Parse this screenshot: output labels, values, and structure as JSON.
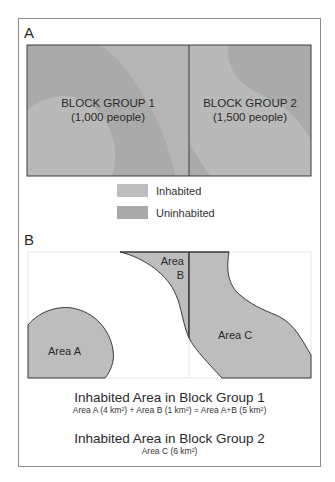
{
  "colors": {
    "inhabited": "#bdbdbd",
    "uninhabited": "#a9a9a9",
    "outline": "#3a3a3a",
    "frame": "#8a8a8a"
  },
  "panel_a": {
    "label": "A",
    "block_groups": [
      {
        "name": "BLOCK GROUP 1",
        "population": "(1,000 people)"
      },
      {
        "name": "BLOCK GROUP 2",
        "population": "(1,500 people)"
      }
    ]
  },
  "legend": {
    "items": [
      {
        "label": "Inhabited",
        "color": "#bdbdbd"
      },
      {
        "label": "Uninhabited",
        "color": "#a9a9a9"
      }
    ]
  },
  "panel_b": {
    "label": "B",
    "areas": [
      {
        "name": "Area A"
      },
      {
        "name_line1": "Area",
        "name_line2": "B"
      },
      {
        "name": "Area C"
      }
    ]
  },
  "captions": [
    {
      "title": "Inhabited Area in Block Group 1",
      "detail": "Area A (4 km²) + Area B (1 km²) = Area A+B (5 km²)"
    },
    {
      "title": "Inhabited Area in Block Group 2",
      "detail": "Area C (6 km²)"
    }
  ]
}
